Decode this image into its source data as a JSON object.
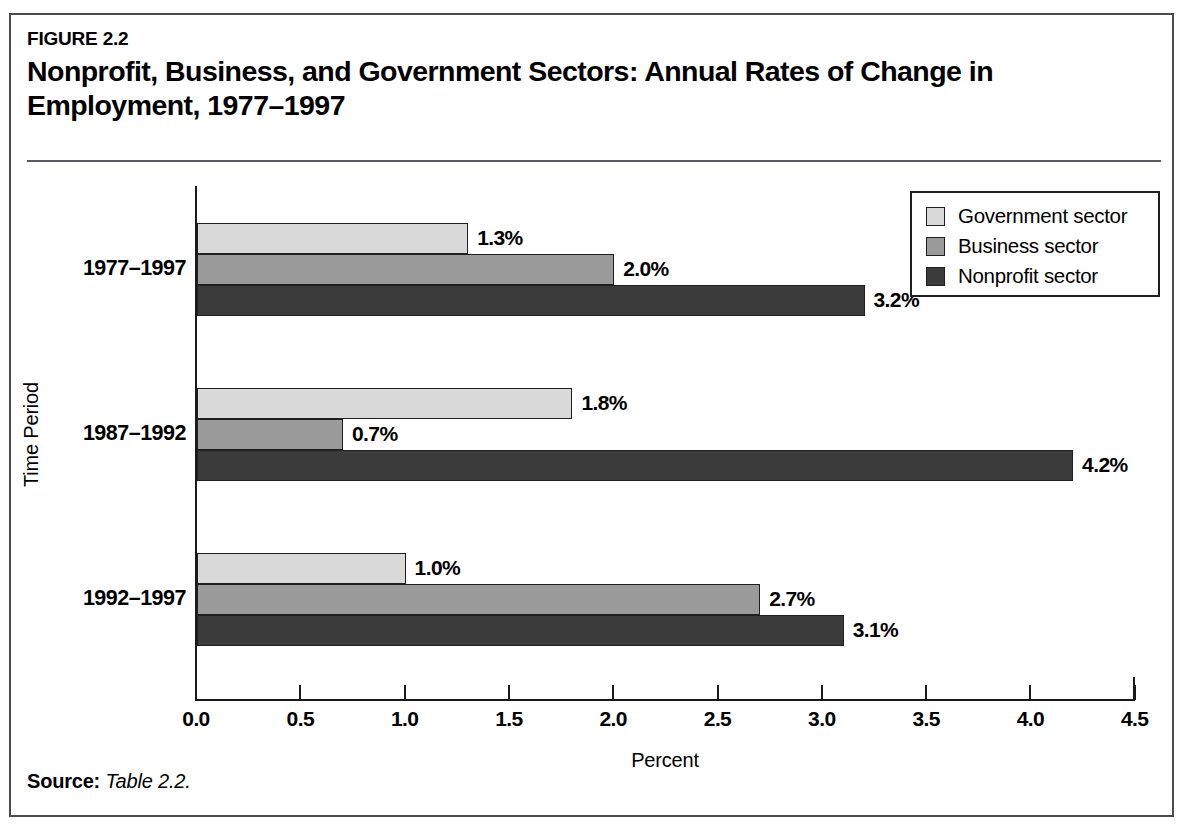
{
  "figure": {
    "number": "FIGURE 2.2",
    "title": "Nonprofit, Business, and Government Sectors: Annual Rates of Change in Employment, 1977–1997",
    "source_label": "Source:",
    "source_text": "Table 2.2."
  },
  "chart_data": {
    "type": "bar",
    "orientation": "horizontal",
    "title": "Nonprofit, Business, and Government Sectors: Annual Rates of Change in Employment, 1977–1997",
    "xlabel": "Percent",
    "ylabel": "Time Period",
    "categories": [
      "1977–1997",
      "1987–1992",
      "1992–1997"
    ],
    "series": [
      {
        "name": "Government sector",
        "color": "#d9d9d9",
        "values": [
          1.3,
          1.8,
          1.0
        ],
        "labels": [
          "1.3%",
          "1.8%",
          "1.0%"
        ]
      },
      {
        "name": "Business sector",
        "color": "#9a9a9a",
        "values": [
          2.0,
          0.7,
          2.7
        ],
        "labels": [
          "2.0%",
          "0.7%",
          "2.7%"
        ]
      },
      {
        "name": "Nonprofit sector",
        "color": "#3b3b3b",
        "values": [
          3.2,
          4.2,
          3.1
        ],
        "labels": [
          "3.2%",
          "4.2%",
          "3.1%"
        ]
      }
    ],
    "xlim": [
      0.0,
      4.5
    ],
    "xticks": [
      0.0,
      0.5,
      1.0,
      1.5,
      2.0,
      2.5,
      3.0,
      3.5,
      4.0,
      4.5
    ],
    "xtick_labels": [
      "0.0",
      "0.5",
      "1.0",
      "1.5",
      "2.0",
      "2.5",
      "3.0",
      "3.5",
      "4.0",
      "4.5"
    ],
    "grid": false,
    "legend_position": "top-right",
    "legend_entries": [
      "Government sector",
      "Business sector",
      "Nonprofit sector"
    ]
  }
}
